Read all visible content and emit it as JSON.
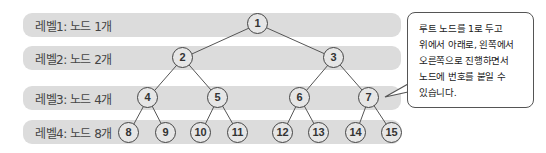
{
  "levels": [
    {
      "label": "레벨1: 노드 1개",
      "top": 13
    },
    {
      "label": "레벨2: 노드 2개",
      "top": 46
    },
    {
      "label": "레벨3: 노드 4개",
      "top": 86
    },
    {
      "label": "레벨4: 노드 8개",
      "top": 120
    }
  ],
  "nodes": [
    {
      "id": "1",
      "x": 258,
      "y": 24
    },
    {
      "id": "2",
      "x": 183,
      "y": 58
    },
    {
      "id": "3",
      "x": 334,
      "y": 58
    },
    {
      "id": "4",
      "x": 148,
      "y": 98
    },
    {
      "id": "5",
      "x": 218,
      "y": 98
    },
    {
      "id": "6",
      "x": 300,
      "y": 98
    },
    {
      "id": "7",
      "x": 369,
      "y": 98
    },
    {
      "id": "8",
      "x": 129,
      "y": 133
    },
    {
      "id": "9",
      "x": 166,
      "y": 133
    },
    {
      "id": "10",
      "x": 201,
      "y": 133
    },
    {
      "id": "11",
      "x": 238,
      "y": 133
    },
    {
      "id": "12",
      "x": 283,
      "y": 133
    },
    {
      "id": "13",
      "x": 319,
      "y": 133
    },
    {
      "id": "14",
      "x": 356,
      "y": 133
    },
    {
      "id": "15",
      "x": 392,
      "y": 133
    }
  ],
  "edges": [
    [
      "1",
      "2"
    ],
    [
      "1",
      "3"
    ],
    [
      "2",
      "4"
    ],
    [
      "2",
      "5"
    ],
    [
      "3",
      "6"
    ],
    [
      "3",
      "7"
    ],
    [
      "4",
      "8"
    ],
    [
      "4",
      "9"
    ],
    [
      "5",
      "10"
    ],
    [
      "5",
      "11"
    ],
    [
      "6",
      "12"
    ],
    [
      "6",
      "13"
    ],
    [
      "7",
      "14"
    ],
    [
      "7",
      "15"
    ]
  ],
  "callout": {
    "lines": [
      "루트 노드를 1로 두고",
      "위에서 아래로, 왼쪽에서",
      "오른쪽으로 진행하면서",
      "노드에 번호를 붙일 수",
      "있습니다."
    ]
  },
  "colors": {
    "band": "#dcdcdc",
    "node_fill": "#e6e6e6",
    "stroke": "#444444"
  }
}
